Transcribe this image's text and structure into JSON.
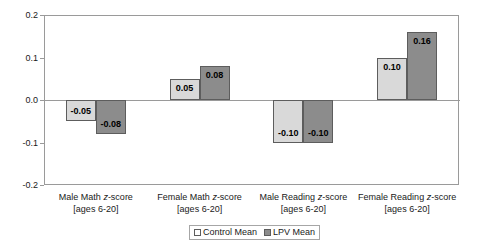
{
  "chart_data": {
    "type": "bar",
    "title": "",
    "xlabel": "",
    "ylabel": "",
    "ylim": [
      -0.2,
      0.2
    ],
    "yticks": [
      "0.2",
      "0.1",
      "0.0",
      "-0.1",
      "-0.2"
    ],
    "ytick_values": [
      0.2,
      0.1,
      0.0,
      -0.1,
      -0.2
    ],
    "grid": false,
    "legend_position": "bottom-center",
    "categories": [
      "Male Math z-score [ages 6-20]",
      "Female Math z-score [ages 6-20]",
      "Male Reading z-score [ages 6-20]",
      "Female Reading z-score [ages 6-20]"
    ],
    "category_lines": [
      {
        "line1": "Male Math ",
        "zitalic": "z",
        "line1b": "-score",
        "line2": "[ages 6-20]"
      },
      {
        "line1": "Female Math ",
        "zitalic": "z",
        "line1b": "-score",
        "line2": "[ages 6-20]"
      },
      {
        "line1": "Male Reading ",
        "zitalic": "z",
        "line1b": "-score",
        "line2": "[ages 6-20]"
      },
      {
        "line1": "Female Reading ",
        "zitalic": "z",
        "line1b": "-score",
        "line2": "[ages 6-20]"
      }
    ],
    "series": [
      {
        "name": "Control Mean",
        "color": "#d9d9d9",
        "values": [
          -0.05,
          0.05,
          -0.1,
          0.1
        ],
        "labels": [
          "-0.05",
          "0.05",
          "-0.10",
          "0.10"
        ]
      },
      {
        "name": "LPV Mean",
        "color": "#8c8c8c",
        "values": [
          -0.08,
          0.08,
          -0.1,
          0.16
        ],
        "labels": [
          "-0.08",
          "0.08",
          "-0.10",
          "0.16"
        ]
      }
    ]
  },
  "legend": {
    "entries": [
      {
        "label": "Control Mean"
      },
      {
        "label": "LPV Mean"
      }
    ]
  },
  "colors": {
    "control_fill": "#d9d9d9",
    "lpv_fill": "#8c8c8c",
    "bar_border": "#5d5d5d",
    "axis": "#9a9a9a",
    "text": "#1a1a1a"
  }
}
